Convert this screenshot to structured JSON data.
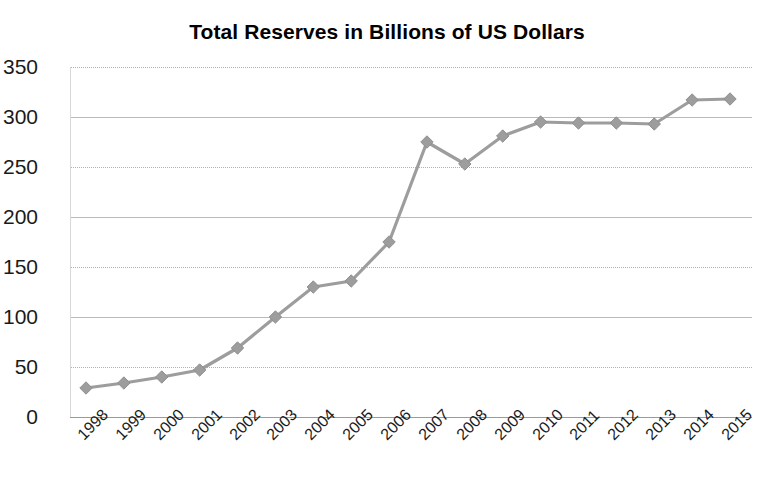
{
  "chart_data": {
    "type": "line",
    "title": "Total Reserves in Billions of US Dollars",
    "xlabel": "",
    "ylabel": "",
    "categories": [
      "1998",
      "1999",
      "2000",
      "2001",
      "2002",
      "2003",
      "2004",
      "2005",
      "2006",
      "2007",
      "2008",
      "2009",
      "2010",
      "2011",
      "2012",
      "2013",
      "2014",
      "2015"
    ],
    "values": [
      29,
      34,
      40,
      47,
      69,
      100,
      130,
      136,
      175,
      275,
      253,
      281,
      295,
      294,
      294,
      293,
      317,
      318
    ],
    "series": [
      {
        "name": "Total Reserves",
        "values": [
          29,
          34,
          40,
          47,
          69,
          100,
          130,
          136,
          175,
          275,
          253,
          281,
          295,
          294,
          294,
          293,
          317,
          318
        ]
      }
    ],
    "ylim": [
      0,
      350
    ],
    "ytick_labels": [
      "0",
      "50",
      "100",
      "150",
      "200",
      "250",
      "300",
      "350"
    ],
    "ytick_values": [
      0,
      50,
      100,
      150,
      200,
      250,
      300,
      350
    ],
    "grid": true,
    "grid_axis": "y",
    "legend": false,
    "legend_position": "none",
    "marker": "diamond",
    "series_color": "#9d9d9d",
    "grid_color": "#b9b9b9",
    "axis_color": "#9a9a9a",
    "text_color": "#1a1a1a",
    "background_color": "#ffffff",
    "xtick_rotation": -45
  }
}
